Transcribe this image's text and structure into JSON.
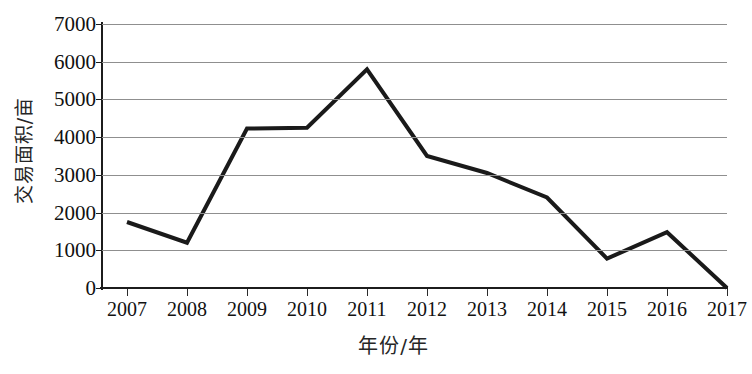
{
  "chart_data": {
    "type": "line",
    "title": "",
    "xlabel": "年份/年",
    "ylabel": "交易面积/亩",
    "categories": [
      "2007",
      "2008",
      "2009",
      "2010",
      "2011",
      "2012",
      "2013",
      "2014",
      "2015",
      "2016",
      "2017"
    ],
    "values": [
      1750,
      1200,
      4230,
      4250,
      5800,
      3500,
      3050,
      2400,
      780,
      1480,
      0
    ],
    "series": [
      {
        "name": "交易面积",
        "values": [
          1750,
          1200,
          4230,
          4250,
          5800,
          3500,
          3050,
          2400,
          780,
          1480,
          0
        ]
      }
    ],
    "ylim": [
      0,
      7000
    ],
    "ytick_labels": [
      "7000",
      "6000",
      "5000",
      "4000",
      "3000",
      "2000",
      "1000",
      "0"
    ],
    "ytick_values": [
      7000,
      6000,
      5000,
      4000,
      3000,
      2000,
      1000,
      0
    ],
    "xtick_labels": [
      "2007",
      "2008",
      "2009",
      "2010",
      "2011",
      "2012",
      "2013",
      "2014",
      "2015",
      "2016",
      "2017"
    ],
    "grid": "horizontal",
    "legend": "none",
    "colors": {
      "line": "#1a1a1a",
      "grid": "#8f8f8f",
      "axis": "#1c1c1c",
      "background": "#ffffff",
      "text": "#111111"
    },
    "line_width": 4
  }
}
